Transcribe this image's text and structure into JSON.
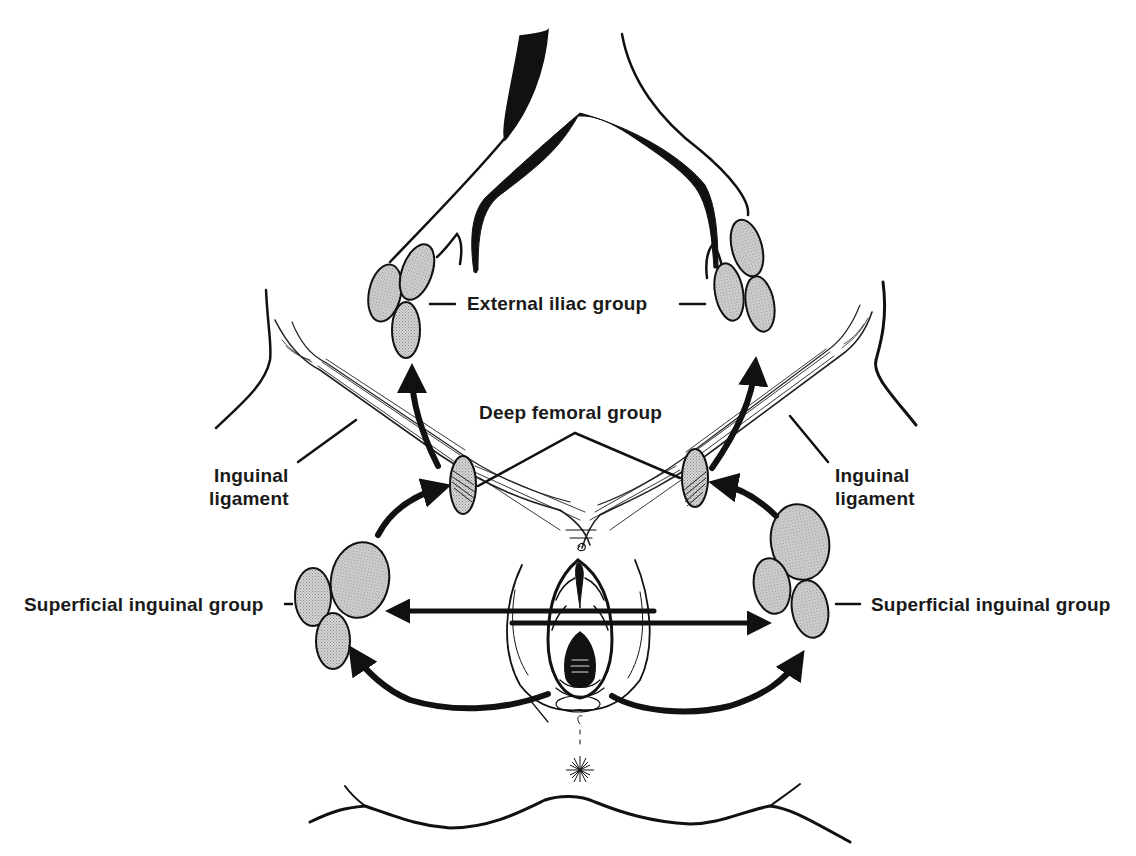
{
  "diagram": {
    "colors": {
      "ink": "#111111",
      "node_fill": "#c8c8c8",
      "background": "#ffffff"
    },
    "labels": {
      "external_iliac": "External iliac group",
      "deep_femoral": "Deep femoral group",
      "inguinal_ligament_left_line1": "Inguinal",
      "inguinal_ligament_left_line2": "ligament",
      "inguinal_ligament_right_line1": "Inguinal",
      "inguinal_ligament_right_line2": "ligament",
      "superficial_inguinal_left": "Superficial inguinal group",
      "superficial_inguinal_right": "Superficial inguinal group"
    },
    "node_groups": [
      {
        "name": "External iliac group",
        "side": "left",
        "node_count": 3
      },
      {
        "name": "External iliac group",
        "side": "right",
        "node_count": 3
      },
      {
        "name": "Deep femoral group",
        "side": "left",
        "node_count": 1
      },
      {
        "name": "Deep femoral group",
        "side": "right",
        "node_count": 1
      },
      {
        "name": "Superficial inguinal group",
        "side": "left",
        "node_count": 3
      },
      {
        "name": "Superficial inguinal group",
        "side": "right",
        "node_count": 3
      }
    ],
    "flows": [
      {
        "from": "Vulva",
        "to": "Superficial inguinal group (left)"
      },
      {
        "from": "Vulva",
        "to": "Superficial inguinal group (right)"
      },
      {
        "from": "Vulva",
        "to": "Contralateral superficial inguinal group (crossing)"
      },
      {
        "from": "Superficial inguinal group",
        "to": "Deep femoral group"
      },
      {
        "from": "Deep femoral group",
        "to": "External iliac group"
      }
    ]
  }
}
